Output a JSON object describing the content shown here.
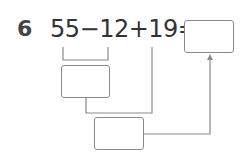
{
  "problem": {
    "number": "6",
    "expression": "55−12+19=",
    "operands": [
      "55",
      "12",
      "19"
    ],
    "operators": [
      "−",
      "+"
    ]
  },
  "boxes": {
    "result": "",
    "step1": "",
    "step2": ""
  },
  "colors": {
    "text": "#333333",
    "line": "#8a8a8a"
  }
}
